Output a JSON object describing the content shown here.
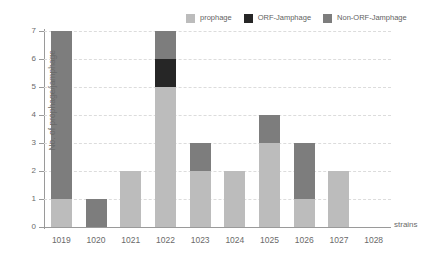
{
  "chart_data": {
    "type": "bar",
    "stacked": true,
    "title": "",
    "xlabel": "strains",
    "ylabel": "No. of prophage/jamphage",
    "categories": [
      "1019",
      "1020",
      "1021",
      "1022",
      "1023",
      "1024",
      "1025",
      "1026",
      "1027",
      "1028"
    ],
    "series": [
      {
        "name": "prophage",
        "color": "#bcbcbc",
        "values": [
          1,
          0,
          2,
          5,
          2,
          2,
          3,
          1,
          2,
          0
        ]
      },
      {
        "name": "ORF-Jamphage",
        "color": "#262626",
        "values": [
          0,
          0,
          0,
          1,
          0,
          0,
          0,
          0,
          0,
          0
        ]
      },
      {
        "name": "Non-ORF-Jamphage",
        "color": "#7d7d7d",
        "values": [
          6,
          1,
          0,
          1,
          1,
          0,
          1,
          2,
          0,
          0
        ]
      }
    ],
    "totals": [
      7,
      1,
      2,
      7,
      3,
      2,
      4,
      3,
      2,
      0
    ],
    "ylim": [
      0,
      7
    ],
    "yticks": [
      0,
      1,
      2,
      3,
      4,
      5,
      6,
      7
    ],
    "ytick_labels": [
      "0",
      "1",
      "2",
      "3",
      "4",
      "5",
      "6",
      "7"
    ],
    "grid": "horizontal-dashed",
    "legend_position": "top-right"
  },
  "legend": {
    "items": [
      {
        "label": "prophage"
      },
      {
        "label": "ORF-Jamphage"
      },
      {
        "label": "Non-ORF-Jamphage"
      }
    ]
  },
  "axes": {
    "x_title": "strains",
    "y_title": "No. of prophage/jamphage"
  }
}
